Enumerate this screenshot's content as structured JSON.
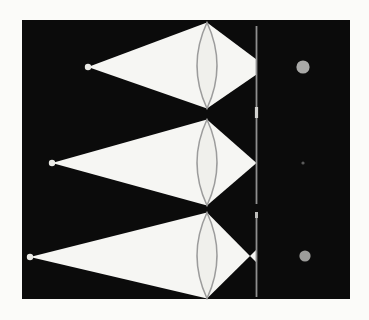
{
  "figure": {
    "title": "",
    "page_background": "#fbfbf9",
    "field": {
      "x": 22,
      "y": 20,
      "width": 328,
      "height": 279,
      "color": "#0b0b0b"
    },
    "cone_color": "#f6f6f3",
    "lens_fill": "#f0f0ec",
    "lens_stroke": "#9c9c9c",
    "source_color": "#eaeae6",
    "blur_softness": 0.7
  },
  "screen": {
    "x": 256.5,
    "segments": [
      {
        "top": 26,
        "bottom": 204
      },
      {
        "top": 212,
        "bottom": 297
      }
    ],
    "width": 1.8,
    "color": "#8f8f8f",
    "marks": [
      {
        "y": 107,
        "height": 11,
        "width": 3.2,
        "color": "#d2d2d0"
      },
      {
        "y": 212,
        "height": 6,
        "width": 3.0,
        "color": "#bdbdbb"
      }
    ]
  },
  "rows": [
    {
      "name": "focus-behind-screen",
      "condition": "converging rays truncated by screen before focus; blurred disk on screen",
      "source": {
        "x": 88,
        "y": 67,
        "r": 3.2
      },
      "lens": {
        "cx": 207,
        "cy": 65.5,
        "half_height": 43,
        "half_width": 10
      },
      "cone_in": [
        [
          88,
          67
        ],
        [
          207,
          22.5
        ],
        [
          207,
          108.5
        ]
      ],
      "cone_out": [
        [
          207,
          22.5
        ],
        [
          256.5,
          59.5
        ],
        [
          256.5,
          74.5
        ],
        [
          207,
          108.5
        ]
      ],
      "refocus": null,
      "spot": {
        "x": 303,
        "y": 67,
        "r": 6.6,
        "color": "#a9a9a7"
      }
    },
    {
      "name": "in-focus-on-screen",
      "condition": "rays converge exactly on the screen; sharp point image",
      "source": {
        "x": 52,
        "y": 163,
        "r": 3.2
      },
      "lens": {
        "cx": 207,
        "cy": 162.5,
        "half_height": 43,
        "half_width": 10
      },
      "cone_in": [
        [
          52,
          163
        ],
        [
          207,
          119.5
        ],
        [
          207,
          205.5
        ]
      ],
      "cone_out": [
        [
          207,
          119.5
        ],
        [
          256.5,
          163
        ],
        [
          207,
          205.5
        ]
      ],
      "refocus": null,
      "spot": {
        "x": 303,
        "y": 163,
        "r": 1.6,
        "color": "#5a5a5a"
      }
    },
    {
      "name": "focus-in-front-of-screen",
      "condition": "rays focus before the screen then diverge; blurred disk on screen",
      "source": {
        "x": 30,
        "y": 257,
        "r": 3.2
      },
      "lens": {
        "cx": 207,
        "cy": 255.5,
        "half_height": 43,
        "half_width": 10
      },
      "cone_in": [
        [
          30,
          257
        ],
        [
          207,
          212.5
        ],
        [
          207,
          298.5
        ]
      ],
      "cone_out": [
        [
          207,
          212.5
        ],
        [
          250,
          256
        ],
        [
          207,
          298.5
        ]
      ],
      "refocus": [
        [
          250,
          256
        ],
        [
          256.5,
          249.5
        ],
        [
          256.5,
          262.5
        ]
      ],
      "spot": {
        "x": 305,
        "y": 256,
        "r": 5.6,
        "color": "#9c9c9a"
      }
    }
  ]
}
